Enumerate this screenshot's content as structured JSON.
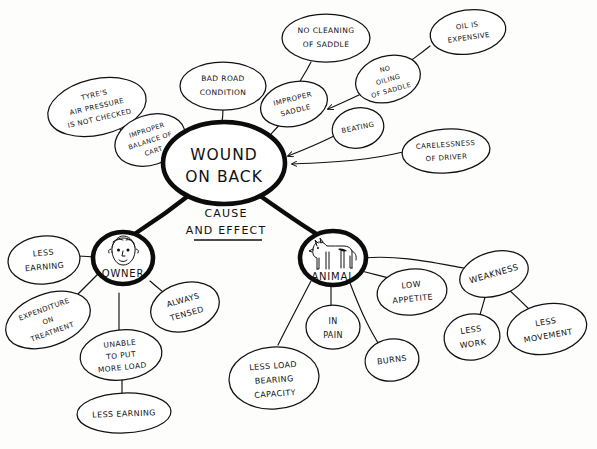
{
  "diagram": {
    "style": "hand-drawn",
    "center_caption": {
      "line1": "CAUSE",
      "line2": "AND EFFECT"
    },
    "colors": {
      "ink": "#111111",
      "paper": "#fdfdfb"
    },
    "nodes": {
      "center": {
        "line1": "WOUND",
        "line2": "ON BACK"
      },
      "owner": {
        "label": "OWNER",
        "icon": "man-face-sketch"
      },
      "animal": {
        "label": "ANIMAL",
        "icon": "horse-sketch"
      },
      "causes": [
        {
          "id": "tyres",
          "lines": [
            "TYRE'S",
            "AIR  PRESSURE",
            "IS NOT CHECKED"
          ]
        },
        {
          "id": "improper-balance",
          "lines": [
            "IMPROPER",
            "BALANCE OF",
            "CART"
          ]
        },
        {
          "id": "bad-road",
          "lines": [
            "BAD ROAD",
            "CONDITION"
          ]
        },
        {
          "id": "no-cleaning",
          "lines": [
            "NO CLEANING",
            "OF SADDLE"
          ]
        },
        {
          "id": "improper-saddle",
          "lines": [
            "IMPROPER",
            "SADDLE"
          ]
        },
        {
          "id": "no-oiling",
          "lines": [
            "NO",
            "OILING",
            "OF SADDLE"
          ]
        },
        {
          "id": "oil-expensive",
          "lines": [
            "OIL  IS",
            "EXPENSIVE"
          ]
        },
        {
          "id": "beating",
          "lines": [
            "BEATING"
          ]
        },
        {
          "id": "carelessness",
          "lines": [
            "CARELESSNESS",
            "OF DRIVER"
          ]
        }
      ],
      "owner_effects": [
        {
          "id": "less-earning-top",
          "lines": [
            "LESS",
            "EARNING"
          ]
        },
        {
          "id": "expenditure",
          "lines": [
            "EXPENDITURE",
            "ON",
            "TREATMENT"
          ]
        },
        {
          "id": "unable-load",
          "lines": [
            "UNABLE",
            "TO PUT",
            "MORE LOAD"
          ]
        },
        {
          "id": "less-earning-bottom",
          "lines": [
            "LESS EARNING"
          ]
        },
        {
          "id": "always-tensed",
          "lines": [
            "ALWAYS",
            "TENSED"
          ]
        }
      ],
      "animal_effects": [
        {
          "id": "less-load-capacity",
          "lines": [
            "LESS LOAD",
            "BEARING",
            "CAPACITY"
          ]
        },
        {
          "id": "in-pain",
          "lines": [
            "IN",
            "PAIN"
          ]
        },
        {
          "id": "burns",
          "lines": [
            "BURNS"
          ]
        },
        {
          "id": "low-appetite",
          "lines": [
            "LOW",
            "APPETITE"
          ]
        },
        {
          "id": "weakness",
          "lines": [
            "WEAKNESS"
          ]
        },
        {
          "id": "less-work",
          "lines": [
            "LESS",
            "WORK"
          ]
        },
        {
          "id": "less-movement",
          "lines": [
            "LESS",
            "MOVEMENT"
          ]
        }
      ]
    }
  }
}
